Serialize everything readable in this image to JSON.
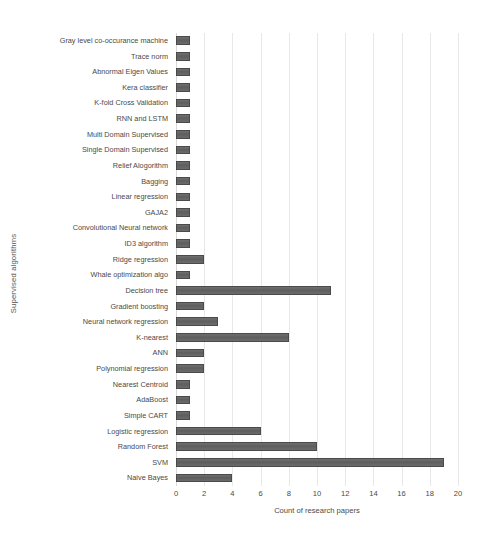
{
  "chart_data": {
    "type": "bar",
    "orientation": "horizontal",
    "title": "",
    "xlabel": "Count of research papers",
    "ylabel": "Supervised algorithms",
    "xlim": [
      0,
      20
    ],
    "xticks": [
      0,
      2,
      4,
      6,
      8,
      10,
      12,
      14,
      16,
      18,
      20
    ],
    "grid": "vertical",
    "legend": "none",
    "bar_color": "#636363",
    "bar_edge_color": "#4a4a4a",
    "categories": [
      "Gray level co-occurance machine",
      "Trace norm",
      "Abnormal Eigen Values",
      "Kera  classifier",
      "K-fold Cross Validation",
      "RNN and LSTM",
      "Multi Domain Supervised",
      "Single Domain Supervised",
      "Relief Alogorithm",
      "Bagging",
      "Linear regression",
      "GAJA2",
      "Convolutional Neural network",
      "ID3 algorithm",
      "Ridge regression",
      "Whale optimization algo",
      "Decision tree",
      "Gradient boosting",
      "Neural network regression",
      "K-nearest",
      "ANN",
      "Polynomial regression",
      "Nearest Centroid",
      "AdaBoost",
      "Simple CART",
      "Logistic regression",
      "Random Forest",
      "SVM",
      "Naive Bayes"
    ],
    "values": [
      1,
      1,
      1,
      1,
      1,
      1,
      1,
      1,
      1,
      1,
      1,
      1,
      1,
      1,
      2,
      1,
      11,
      2,
      3,
      8,
      2,
      2,
      1,
      1,
      1,
      6,
      10,
      19,
      4
    ]
  }
}
